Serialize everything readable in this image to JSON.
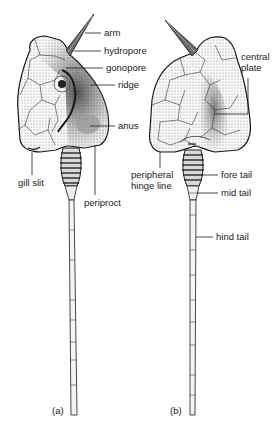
{
  "figure": {
    "panels": [
      {
        "id": "a",
        "caption": "(a)",
        "labels": {
          "arm": "arm",
          "hydropore": "hydropore",
          "gonopore": "gonopore",
          "ridge": "ridge",
          "anus": "anus",
          "gill_slit": "gill slit",
          "periproct": "periproct"
        }
      },
      {
        "id": "b",
        "caption": "(b)",
        "labels": {
          "central_plate_1": "central",
          "central_plate_2": "plate",
          "peripheral_hinge_1": "peripheral",
          "peripheral_hinge_2": "hinge line",
          "fore_tail": "fore tail",
          "mid_tail": "mid tail",
          "hind_tail": "hind tail"
        }
      }
    ],
    "colors": {
      "ink": "#1a1a1a",
      "shade": "#8a8a8a",
      "background": "#ffffff"
    }
  }
}
